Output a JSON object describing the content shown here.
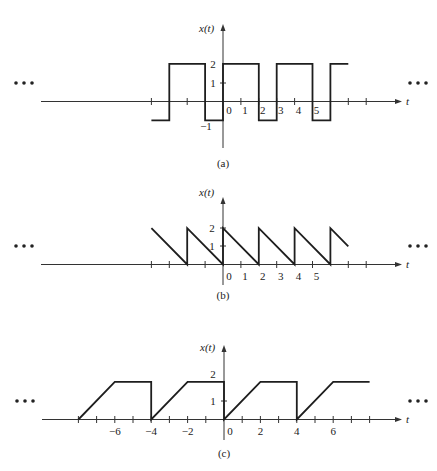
{
  "figure": {
    "panels": [
      {
        "id": "a",
        "caption": "(a)",
        "ylabel": "x(t)",
        "xlabel": "t",
        "ellipsis_left": "•••",
        "ellipsis_right": "•••"
      },
      {
        "id": "b",
        "caption": "(b)",
        "ylabel": "x(t)",
        "xlabel": "t",
        "ellipsis_left": "•••",
        "ellipsis_right": "•••"
      },
      {
        "id": "c",
        "caption": "(c)",
        "ylabel": "x(t)",
        "xlabel": "t",
        "ellipsis_left": "•••",
        "ellipsis_right": "•••"
      }
    ]
  },
  "chart_data": [
    {
      "type": "line",
      "title": "(a)",
      "xlabel": "t",
      "ylabel": "x(t)",
      "description": "Periodic square-like wave, period 3: x=2 for 0<t<2, x=-1 for 2<t<3; continues indefinitely (ellipses on both sides)",
      "x_tick_positions": [
        -4,
        -2,
        1,
        2,
        3,
        4,
        5,
        7,
        8
      ],
      "x_tick_labels": [
        "0",
        "1",
        "2",
        "3",
        "4",
        "5"
      ],
      "x_tick_label_values": [
        0,
        1,
        2,
        3,
        4,
        5
      ],
      "y_tick_labels": [
        "2",
        "1",
        "-1"
      ],
      "y_tick_values": [
        2,
        1,
        -1
      ],
      "x": [
        -4,
        -3,
        -3,
        -1,
        -1,
        0,
        0,
        2,
        2,
        3,
        3,
        5,
        5,
        6,
        6,
        7
      ],
      "y": [
        -1,
        -1,
        2,
        2,
        -1,
        -1,
        2,
        2,
        -1,
        -1,
        2,
        2,
        -1,
        -1,
        2,
        2
      ],
      "xlim": [
        -10.3,
        10.0
      ],
      "ylim": [
        -2.5,
        4
      ],
      "period": 3,
      "grid": false
    },
    {
      "type": "line",
      "title": "(b)",
      "xlabel": "t",
      "ylabel": "x(t)",
      "description": "Periodic sawtooth, period 2: x(t)=2-t on 0<=t<2, jumps back to 2 at even t; continues indefinitely",
      "x_tick_positions": [
        -4,
        -3,
        -1,
        1,
        3,
        5,
        7,
        8
      ],
      "x_tick_labels": [
        "0",
        "1",
        "2",
        "3",
        "4",
        "5"
      ],
      "x_tick_label_values": [
        0,
        1,
        2,
        3,
        4,
        5
      ],
      "y_tick_labels": [
        "2",
        "1"
      ],
      "y_tick_values": [
        2,
        1
      ],
      "x": [
        -4,
        -2,
        -2,
        0,
        0,
        2,
        2,
        4,
        4,
        6,
        6,
        7
      ],
      "y": [
        2,
        0,
        2,
        0,
        2,
        0,
        2,
        0,
        2,
        0,
        2,
        1
      ],
      "xlim": [
        -10.3,
        10.0
      ],
      "ylim": [
        -1,
        4
      ],
      "period": 2,
      "grid": false
    },
    {
      "type": "line",
      "title": "(c)",
      "xlabel": "t",
      "ylabel": "x(t)",
      "description": "Periodic ramp-and-hold, period 4: x rises linearly from 0 at t=0 to 2 at t=2, holds at 2 until t=4, drops to 0; continues indefinitely",
      "x_tick_positions": [
        -8,
        -7,
        -6,
        -5,
        -4,
        -3,
        -2,
        -1,
        1,
        2,
        3,
        4,
        5,
        6,
        7,
        8
      ],
      "x_tick_labels": [
        "-6",
        "-4",
        "-2",
        "0",
        "2",
        "4",
        "6"
      ],
      "x_tick_label_values": [
        -6,
        -4,
        -2,
        0,
        2,
        4,
        6
      ],
      "y_tick_labels": [
        "2",
        "1"
      ],
      "y_tick_values": [
        2,
        1
      ],
      "x": [
        -8,
        -6,
        -4,
        -4,
        -2,
        0,
        0,
        2,
        4,
        4,
        6,
        8
      ],
      "y": [
        0,
        2,
        2,
        0,
        2,
        2,
        0,
        2,
        2,
        0,
        2,
        2
      ],
      "xlim": [
        -10.0,
        10.0
      ],
      "ylim": [
        -1,
        4
      ],
      "period": 4,
      "grid": false
    }
  ]
}
